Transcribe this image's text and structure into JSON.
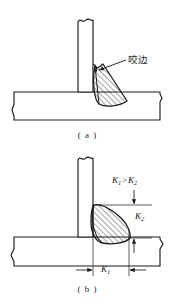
{
  "figure": {
    "background_color": "#ffffff",
    "line_color": "#1a1a1a",
    "hatch_color": "#1a1a1a",
    "panels": [
      {
        "id": "a",
        "caption": "( a )",
        "description": "T-joint fillet weld with undercut defect at the toe on the vertical plate",
        "annotations": [
          {
            "name": "undercut-label",
            "text": "咬边",
            "meaning": "undercut",
            "leader_line": true
          }
        ]
      },
      {
        "id": "b",
        "caption": "( b )",
        "description": "T-joint fillet weld with unequal leg lengths, horizontal leg larger than vertical leg",
        "annotations": [
          {
            "name": "k-relation-label",
            "symbol_left": "K",
            "sub_left": "1",
            "operator": ">",
            "symbol_right": "K",
            "sub_right": "2"
          },
          {
            "name": "k2-label",
            "symbol": "K",
            "sub": "2",
            "orientation": "vertical-dimension"
          },
          {
            "name": "k1-label",
            "symbol": "K",
            "sub": "1",
            "orientation": "horizontal-dimension"
          }
        ]
      }
    ]
  },
  "captions": {
    "a": "( a )",
    "b": "( b )"
  },
  "labels": {
    "undercut": "咬边",
    "k_symbol": "K",
    "k1_sub": "1",
    "k2_sub": "2",
    "greater_than": ">"
  }
}
